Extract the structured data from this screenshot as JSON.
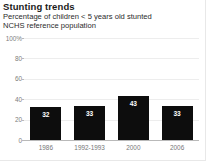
{
  "header": {
    "title": "Stunting trends",
    "subtitle_1": "Percentage of children < 5 years old stunted",
    "subtitle_2": "NCHS reference population"
  },
  "chart_data": {
    "type": "bar",
    "title": "Stunting trends",
    "subtitle": "Percentage of children < 5 years old stunted; NCHS reference population",
    "xlabel": "",
    "ylabel": "",
    "ylim": [
      0,
      100
    ],
    "grid": true,
    "legend": "none",
    "bar_color": "#0d0d0d",
    "value_label_color": "#ffffff",
    "categories": [
      "1986",
      "1992-1993",
      "2000",
      "2006"
    ],
    "values": [
      32,
      33,
      43,
      33
    ],
    "y_ticks": [
      {
        "value": 100,
        "label": "100%"
      },
      {
        "value": 80,
        "label": "80"
      },
      {
        "value": 60,
        "label": "60"
      },
      {
        "value": 40,
        "label": "40"
      },
      {
        "value": 20,
        "label": "20"
      },
      {
        "value": 0,
        "label": "0"
      }
    ]
  }
}
